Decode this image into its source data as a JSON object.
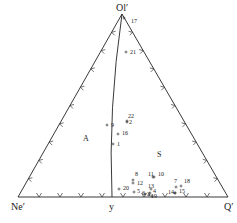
{
  "diagram": {
    "type": "ternary",
    "vertices": {
      "top": {
        "label": "Ol′",
        "x": 122,
        "y": 14
      },
      "left": {
        "label": "Ne′",
        "x": 18,
        "y": 197
      },
      "right": {
        "label": "Q′",
        "x": 228,
        "y": 197
      }
    },
    "base_point": {
      "label": "y",
      "x": 112,
      "y": 197
    },
    "fields": [
      {
        "label": "A",
        "x": 86,
        "y": 140
      },
      {
        "label": "S",
        "x": 160,
        "y": 156
      }
    ],
    "points": [
      {
        "id": "17",
        "mx": 124,
        "my": 18,
        "lx": 131,
        "ly": 23
      },
      {
        "id": "21",
        "mx": 126,
        "my": 52,
        "lx": 130,
        "ly": 54
      },
      {
        "id": "22",
        "mx": 127,
        "my": 121,
        "lx": 128,
        "ly": 118
      },
      {
        "id": "2",
        "mx": 127,
        "my": 122,
        "lx": 129,
        "ly": 124
      },
      {
        "id": "9",
        "mx": 107,
        "my": 125,
        "lx": 111,
        "ly": 127
      },
      {
        "id": "16",
        "mx": 118,
        "my": 134,
        "lx": 122,
        "ly": 135
      },
      {
        "id": "1",
        "mx": 113,
        "my": 144,
        "lx": 117,
        "ly": 146
      },
      {
        "id": "8",
        "mx": 133,
        "my": 180,
        "lx": 135,
        "ly": 176
      },
      {
        "id": "12",
        "mx": 133,
        "my": 183,
        "lx": 137,
        "ly": 185
      },
      {
        "id": "11",
        "mx": 153,
        "my": 177,
        "lx": 148,
        "ly": 176
      },
      {
        "id": "10",
        "mx": 154,
        "my": 177,
        "lx": 158,
        "ly": 176
      },
      {
        "id": "13",
        "mx": 151,
        "my": 189,
        "lx": 148,
        "ly": 188
      },
      {
        "id": "20",
        "mx": 119,
        "my": 189,
        "lx": 123,
        "ly": 190
      },
      {
        "id": "5",
        "mx": 134,
        "my": 192,
        "lx": 137,
        "ly": 193
      },
      {
        "id": "6",
        "mx": 145,
        "my": 194,
        "lx": 142,
        "ly": 195
      },
      {
        "id": "4",
        "mx": 150,
        "my": 193,
        "lx": 153,
        "ly": 193
      },
      {
        "id": "3",
        "mx": 149,
        "my": 195,
        "lx": 147,
        "ly": 196
      },
      {
        "id": "19",
        "mx": 152,
        "my": 196,
        "lx": 151,
        "ly": 198
      },
      {
        "id": "7",
        "mx": 176,
        "my": 187,
        "lx": 174,
        "ly": 183
      },
      {
        "id": "18",
        "mx": 181,
        "my": 186,
        "lx": 184,
        "ly": 183
      },
      {
        "id": "14",
        "mx": 175,
        "my": 193,
        "lx": 168,
        "ly": 194
      },
      {
        "id": "15",
        "mx": 175,
        "my": 193,
        "lx": 179,
        "ly": 193
      }
    ],
    "colors": {
      "line": "#222222",
      "background": "#ffffff",
      "text": "#1a1a1a"
    }
  }
}
